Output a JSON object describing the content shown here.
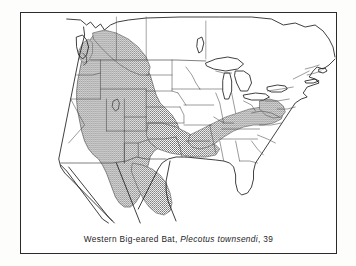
{
  "figure": {
    "kind": "species-distribution-map",
    "caption": {
      "common_name": "Western Big-eared Bat,",
      "scientific_name": "Plecotus townsendi",
      "plate_number": ", 39",
      "full_text": "Western Big-eared Bat, Plecotus townsendi, 39"
    },
    "colors": {
      "ink": "#2b2b2b",
      "coastline": "#1d1d1d",
      "state_border": "#4a4a4a",
      "range_stipple": "#6f6f6f",
      "paper": "#ffffff",
      "page_background": "#fdfdfc"
    },
    "map": {
      "region_label": "North America — contiguous United States with southern Canada and northern Mexico",
      "projection_note": "unlabeled outline map",
      "features": [
        {
          "id": "coastline",
          "label": "continental coastline and international borders"
        },
        {
          "id": "state-borders",
          "label": "state and provincial boundaries"
        },
        {
          "id": "great-lakes",
          "label": "Great Lakes"
        },
        {
          "id": "vancouver-island",
          "label": "Vancouver Island"
        },
        {
          "id": "great-salt-lake",
          "label": "Great Salt Lake"
        },
        {
          "id": "baja-california",
          "label": "Baja California peninsula"
        },
        {
          "id": "florida-peninsula",
          "label": "Florida peninsula"
        },
        {
          "id": "long-island",
          "label": "Long Island"
        },
        {
          "id": "cape-cod",
          "label": "Cape Cod"
        }
      ],
      "range_overlay": {
        "id": "species-range",
        "label": "Shaded distribution range of Western Big-eared Bat",
        "fill_style": "stipple",
        "coverage_note": "Entire western United States from British Columbia south through Baja California and north-central Mexico, extending east across the Great Plains, with a separate arm through the Ozarks and southern Appalachians to Virginia and West Virginia."
      }
    }
  }
}
